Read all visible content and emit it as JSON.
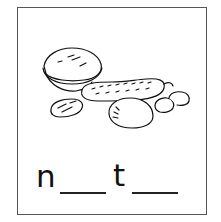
{
  "worksheet": {
    "illustration": "nuts (walnut, peanut pod, almond, hazelnut, peanuts)",
    "word_pattern": {
      "letters": [
        "n",
        "t"
      ],
      "blanks": 2
    }
  },
  "colors": {
    "line": "#111111",
    "border": "#555555",
    "background": "#ffffff"
  }
}
